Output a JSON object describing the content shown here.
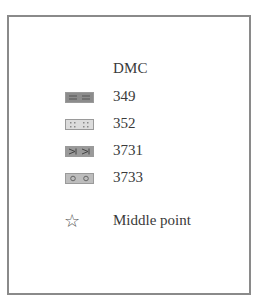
{
  "legend": {
    "heading": "DMC",
    "items": [
      {
        "code": "349",
        "symbol": "double-dash",
        "fill": "#8c8c8c"
      },
      {
        "code": "352",
        "symbol": "dots",
        "fill": "#dcdcdc"
      },
      {
        "code": "3731",
        "symbol": "arrow-bracket",
        "fill": "#9a9a9a"
      },
      {
        "code": "3733",
        "symbol": "circle",
        "fill": "#bdbdbd"
      }
    ],
    "middle_point": {
      "symbol": "☆",
      "label": "Middle point"
    }
  }
}
